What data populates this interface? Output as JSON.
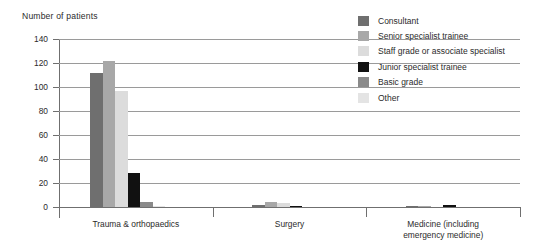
{
  "chart_data": {
    "type": "bar",
    "title": "Number of patients",
    "xlabel": "",
    "ylabel": "Number of patients",
    "ylim": [
      0,
      140
    ],
    "yticks": [
      0,
      20,
      40,
      60,
      80,
      100,
      120,
      140
    ],
    "ytick_labels": [
      "0",
      "20",
      "40",
      "60",
      "80",
      "100",
      "120",
      "140"
    ],
    "grid": true,
    "legend_position": "top-right",
    "categories": [
      "Trauma & orthopaedics",
      "Surgery",
      "Medicine (including emergency medicine)"
    ],
    "category_lines": [
      [
        "Trauma & orthopaedics"
      ],
      [
        "Surgery"
      ],
      [
        "Medicine (including",
        "emergency medicine)"
      ]
    ],
    "series": [
      {
        "name": "Consultant",
        "color": "#6f6f6f",
        "values": [
          112,
          2,
          1
        ]
      },
      {
        "name": "Senior specialist trainee",
        "color": "#a8a8a8",
        "values": [
          122,
          4,
          1
        ]
      },
      {
        "name": "Staff grade or associate specialist",
        "color": "#dcdcdc",
        "values": [
          97,
          3,
          0
        ]
      },
      {
        "name": "Junior specialist trainee",
        "color": "#111111",
        "values": [
          28,
          1,
          2
        ]
      },
      {
        "name": "Basic grade",
        "color": "#8a8a8a",
        "values": [
          4,
          0,
          0
        ]
      },
      {
        "name": "Other",
        "color": "#e4e4e4",
        "values": [
          1,
          0,
          0
        ]
      }
    ]
  },
  "colors": {
    "text": "#2b2b2b",
    "axis": "#6f6f6f",
    "grid": "#9a9a9a",
    "background": "#ffffff"
  }
}
